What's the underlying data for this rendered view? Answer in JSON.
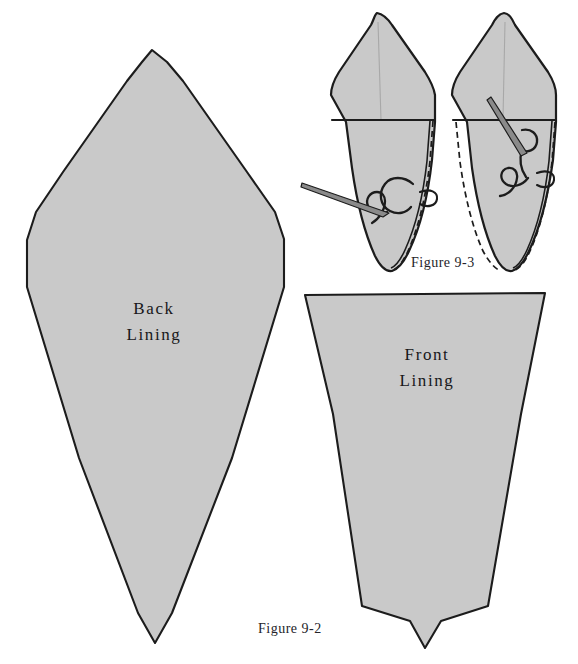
{
  "page": {
    "background_color": "#ffffff",
    "width": 578,
    "height": 664,
    "kind": "sewing-pattern-illustration"
  },
  "style": {
    "piece_fill": "#c9c9c9",
    "piece_fill_light": "#d0d0d0",
    "outline_color": "#1c1c1c",
    "needle_fill": "#8a8a8a",
    "thread_color": "#1c1c1c",
    "text_color": "#17171a"
  },
  "labels": {
    "back_lining": {
      "line1": "Back",
      "line2": "Lining"
    },
    "front_lining": {
      "line1": "Front",
      "line2": "Lining"
    }
  },
  "captions": {
    "figure_9_2": "Figure 9-2",
    "figure_9_3": "Figure 9-3"
  },
  "pieces": [
    {
      "name": "back-lining-pattern",
      "label": "Back Lining",
      "shape": "elongated-kite",
      "outline_points": "152,50 182,80 247,173 284,238 284,286 170,614 155,643 139,614 27,286 27,240 62,173 124,80"
    },
    {
      "name": "front-lining-pattern",
      "label": "Front Lining",
      "shape": "tapered-wedge",
      "outline_points": "305,295 545,293 488,606 440,622 425,648 409,622 361,606"
    }
  ],
  "detail_figures": {
    "caption": "Figure 9-3",
    "items": [
      {
        "name": "stitch-detail-left",
        "description": "folded lining point with needle entering from left and looping thread at seam",
        "needle_direction": "from-lower-left",
        "seam_side": "right",
        "dashed_seam": true
      },
      {
        "name": "stitch-detail-right",
        "description": "folded lining point with needle entering from upper left and looping thread at seam",
        "needle_direction": "from-upper-left",
        "seam_side": "left",
        "dashed_seam": true
      }
    ]
  }
}
